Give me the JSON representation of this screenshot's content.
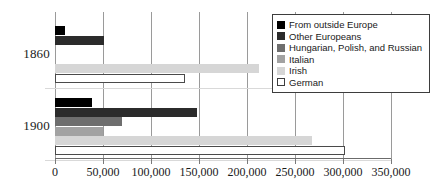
{
  "chart_data": {
    "type": "bar",
    "orientation": "horizontal",
    "title": "",
    "xlabel": "",
    "ylabel": "",
    "categories": [
      "1860",
      "1900"
    ],
    "xlim": [
      0,
      350000
    ],
    "xticks": [
      0,
      50000,
      100000,
      150000,
      200000,
      250000,
      300000,
      350000
    ],
    "xticklabels": [
      "0",
      "50,000",
      "100,000",
      "150,000",
      "200,000",
      "250,000",
      "300,000",
      "350,000"
    ],
    "grid": true,
    "legend_position": "top-right",
    "series": [
      {
        "name": "From outside Europe",
        "color": "#000000",
        "outlined": false,
        "values": [
          10000,
          39000
        ]
      },
      {
        "name": "Other Europeans",
        "color": "#2b2b2b",
        "outlined": false,
        "values": [
          51000,
          148000
        ]
      },
      {
        "name": "Hungarian, Polish, and Russian",
        "color": "#6e6e6e",
        "outlined": false,
        "values": [
          0,
          70000
        ]
      },
      {
        "name": "Italian",
        "color": "#a2a2a2",
        "outlined": false,
        "values": [
          0,
          50000
        ]
      },
      {
        "name": "Irish",
        "color": "#d6d6d6",
        "outlined": false,
        "values": [
          212000,
          268000
        ]
      },
      {
        "name": "German",
        "color": "#ffffff",
        "outlined": true,
        "values": [
          135000,
          302000
        ]
      }
    ]
  },
  "legend": {
    "items": [
      {
        "label": "From outside Europe"
      },
      {
        "label": "Other Europeans"
      },
      {
        "label": "Hungarian, Polish, and Russian"
      },
      {
        "label": "Italian"
      },
      {
        "label": "Irish"
      },
      {
        "label": "German"
      }
    ]
  },
  "axis": {
    "y_labels": [
      "1860",
      "1900"
    ]
  }
}
